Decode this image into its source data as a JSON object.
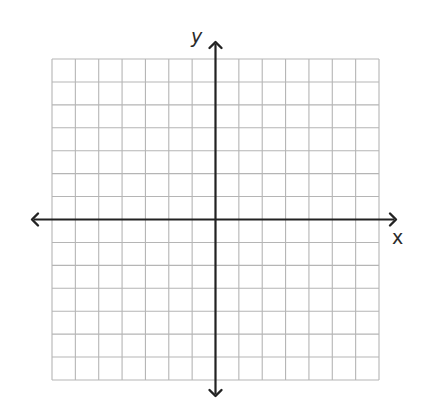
{
  "chart_data": {
    "type": "scatter",
    "title": "",
    "xlabel": "x",
    "ylabel": "y",
    "xlim": [
      -7,
      7
    ],
    "ylim": [
      -7,
      7
    ],
    "grid": true,
    "grid_step": 1,
    "tick_labels": false,
    "axes_arrows": true,
    "series": [],
    "legend": null
  },
  "colors": {
    "grid": "#b5b5b5",
    "axis": "#222222",
    "background": "#ffffff"
  },
  "layout": {
    "grid_left": 52,
    "grid_top": 59,
    "grid_right": 379,
    "grid_bottom": 380,
    "origin_x": 215.5,
    "origin_y": 219.5,
    "xaxis_left_tip": 32,
    "xaxis_right_tip": 396,
    "yaxis_top_tip": 42,
    "yaxis_bottom_tip": 396
  }
}
